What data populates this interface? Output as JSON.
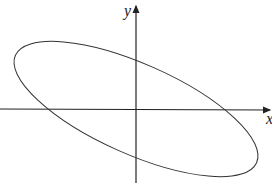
{
  "diagram": {
    "type": "coordinate-plane-with-rotated-ellipse",
    "axes": {
      "x_label": "x",
      "y_label": "y"
    },
    "ellipse": {
      "center": [
        136,
        109
      ],
      "rx": 132,
      "ry": 45,
      "rotation_deg": 24
    },
    "colors": {
      "stroke": "#333333",
      "background": "#ffffff"
    }
  }
}
